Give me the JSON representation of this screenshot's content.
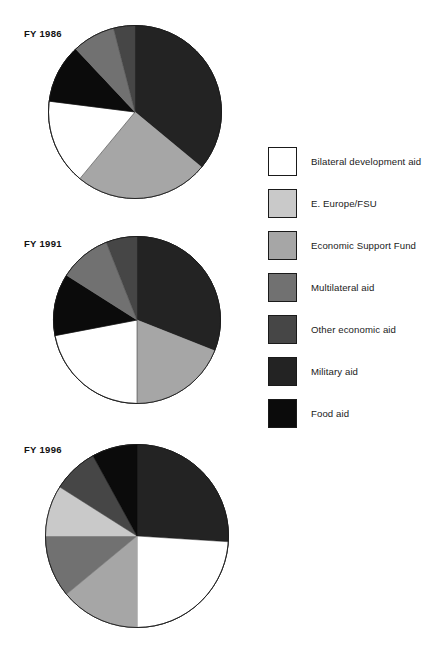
{
  "figure": {
    "cropped_top_title": "",
    "palette": {
      "bilateral_development_aid": "#ffffff",
      "e_europe_fsu": "#c9c9c9",
      "economic_support_fund": "#a6a6a6",
      "multilateral_aid": "#717171",
      "other_economic_aid": "#464646",
      "military_aid": "#232323",
      "food_aid": "#0b0b0b",
      "outline": "#1a1a1a"
    }
  },
  "legend": {
    "items": [
      {
        "label": "Bilateral development aid",
        "color": "#ffffff",
        "key": "bilateral_development_aid"
      },
      {
        "label": "E. Europe/FSU",
        "color": "#c9c9c9",
        "key": "e_europe_fsu"
      },
      {
        "label": "Economic Support Fund",
        "color": "#a6a6a6",
        "key": "economic_support_fund"
      },
      {
        "label": "Multilateral aid",
        "color": "#717171",
        "key": "multilateral_aid"
      },
      {
        "label": "Other economic aid",
        "color": "#464646",
        "key": "other_economic_aid"
      },
      {
        "label": "Military aid",
        "color": "#232323",
        "key": "military_aid"
      },
      {
        "label": "Food aid",
        "color": "#0b0b0b",
        "key": "food_aid"
      }
    ]
  },
  "chart_data": {
    "type": "pie",
    "title": "",
    "xlabel": "",
    "ylabel": "",
    "legend_position": "right",
    "grid": false,
    "units": "percent of total",
    "categories": [
      "Bilateral development aid",
      "E. Europe/FSU",
      "Economic Support Fund",
      "Multilateral aid",
      "Other economic aid",
      "Military aid",
      "Food aid"
    ],
    "colors": [
      "#ffffff",
      "#c9c9c9",
      "#a6a6a6",
      "#717171",
      "#464646",
      "#232323",
      "#0b0b0b"
    ],
    "charts": [
      {
        "label": "FY 1986",
        "start_angle_deg": 0,
        "direction": "clockwise",
        "slices": [
          {
            "name": "Military aid",
            "value": 36,
            "color": "#232323"
          },
          {
            "name": "Economic Support Fund",
            "value": 25,
            "color": "#a6a6a6"
          },
          {
            "name": "Bilateral development aid",
            "value": 16,
            "color": "#ffffff"
          },
          {
            "name": "Food aid",
            "value": 11,
            "color": "#0b0b0b"
          },
          {
            "name": "Multilateral aid",
            "value": 8,
            "color": "#717171"
          },
          {
            "name": "Other economic aid",
            "value": 4,
            "color": "#464646"
          },
          {
            "name": "E. Europe/FSU",
            "value": 0,
            "color": "#c9c9c9"
          }
        ]
      },
      {
        "label": "FY 1991",
        "start_angle_deg": 0,
        "direction": "clockwise",
        "slices": [
          {
            "name": "Military aid",
            "value": 31,
            "color": "#232323"
          },
          {
            "name": "Economic Support Fund",
            "value": 19,
            "color": "#a6a6a6"
          },
          {
            "name": "Bilateral development aid",
            "value": 22,
            "color": "#ffffff"
          },
          {
            "name": "Food aid",
            "value": 12,
            "color": "#0b0b0b"
          },
          {
            "name": "Multilateral aid",
            "value": 10,
            "color": "#717171"
          },
          {
            "name": "Other economic aid",
            "value": 6,
            "color": "#464646"
          },
          {
            "name": "E. Europe/FSU",
            "value": 0,
            "color": "#c9c9c9"
          }
        ]
      },
      {
        "label": "FY 1996",
        "start_angle_deg": 0,
        "direction": "clockwise",
        "slices": [
          {
            "name": "Military aid",
            "value": 26,
            "color": "#232323"
          },
          {
            "name": "Bilateral development aid",
            "value": 24,
            "color": "#ffffff"
          },
          {
            "name": "Economic Support Fund",
            "value": 14,
            "color": "#a6a6a6"
          },
          {
            "name": "Multilateral aid",
            "value": 11,
            "color": "#717171"
          },
          {
            "name": "E. Europe/FSU",
            "value": 9,
            "color": "#c9c9c9"
          },
          {
            "name": "Other economic aid",
            "value": 8,
            "color": "#464646"
          },
          {
            "name": "Food aid",
            "value": 8,
            "color": "#0b0b0b"
          }
        ]
      }
    ]
  }
}
